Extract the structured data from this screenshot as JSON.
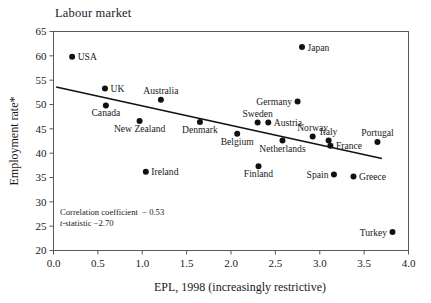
{
  "chart_data": {
    "type": "scatter",
    "title": "Labour market",
    "xlabel": "EPL, 1998 (increasingly restrictive)",
    "ylabel": "Employment rate*",
    "xlim": [
      0.0,
      4.0
    ],
    "ylim": [
      20,
      65
    ],
    "xticks": [
      "0.0",
      "0.5",
      "1.0",
      "1.5",
      "2.0",
      "2.5",
      "3.0",
      "3.5",
      "4.0"
    ],
    "xtick_values": [
      0.0,
      0.5,
      1.0,
      1.5,
      2.0,
      2.5,
      3.0,
      3.5,
      4.0
    ],
    "yticks": [
      "20",
      "25",
      "30",
      "35",
      "40",
      "45",
      "50",
      "55",
      "60",
      "65"
    ],
    "ytick_values": [
      20,
      25,
      30,
      35,
      40,
      45,
      50,
      55,
      60,
      65
    ],
    "grid": false,
    "legend_position": "none",
    "marker": "filled-circle",
    "marker_color": "#111111",
    "trendline": {
      "type": "linear",
      "x_start": 0.03,
      "y_start": 53.6,
      "x_end": 3.7,
      "y_end": 38.9,
      "color": "#111111"
    },
    "points": [
      {
        "label": "USA",
        "x": 0.21,
        "y": 59.8,
        "label_side": "right"
      },
      {
        "label": "UK",
        "x": 0.58,
        "y": 53.3,
        "label_side": "right"
      },
      {
        "label": "Canada",
        "x": 0.59,
        "y": 49.8,
        "label_side": "below"
      },
      {
        "label": "New Zealand",
        "x": 0.97,
        "y": 46.6,
        "label_side": "below"
      },
      {
        "label": "Ireland",
        "x": 1.04,
        "y": 36.2,
        "label_side": "right"
      },
      {
        "label": "Australia",
        "x": 1.21,
        "y": 51.0,
        "label_side": "above"
      },
      {
        "label": "Denmark",
        "x": 1.65,
        "y": 46.4,
        "label_side": "below"
      },
      {
        "label": "Belgium",
        "x": 2.07,
        "y": 44.0,
        "label_side": "below"
      },
      {
        "label": "Sweden",
        "x": 2.3,
        "y": 46.3,
        "label_side": "above"
      },
      {
        "label": "Finland",
        "x": 2.31,
        "y": 37.3,
        "label_side": "below"
      },
      {
        "label": "Austria",
        "x": 2.42,
        "y": 46.3,
        "label_side": "right"
      },
      {
        "label": "Netherlands",
        "x": 2.58,
        "y": 42.6,
        "label_side": "below"
      },
      {
        "label": "Germany",
        "x": 2.75,
        "y": 50.6,
        "label_side": "left"
      },
      {
        "label": "Japan",
        "x": 2.8,
        "y": 61.8,
        "label_side": "right"
      },
      {
        "label": "Norway",
        "x": 2.92,
        "y": 43.4,
        "label_side": "above"
      },
      {
        "label": "Italy",
        "x": 3.1,
        "y": 42.6,
        "label_side": "above"
      },
      {
        "label": "France",
        "x": 3.12,
        "y": 41.5,
        "label_side": "right"
      },
      {
        "label": "Spain",
        "x": 3.16,
        "y": 35.6,
        "label_side": "left"
      },
      {
        "label": "Greece",
        "x": 3.38,
        "y": 35.2,
        "label_side": "right"
      },
      {
        "label": "Portugal",
        "x": 3.65,
        "y": 42.3,
        "label_side": "above"
      },
      {
        "label": "Turkey",
        "x": 3.82,
        "y": 23.8,
        "label_side": "left"
      }
    ],
    "annotations": {
      "correlation_label": "Correlation coefficient",
      "correlation_value": "− 0.53",
      "tstat_prefix": "t",
      "tstat_label": "-statistic",
      "tstat_value": "−2.70"
    }
  }
}
